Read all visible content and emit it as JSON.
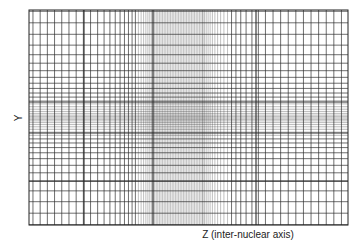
{
  "figure": {
    "x_axis_label": "Z (inter-nuclear axis)",
    "y_axis_label": "Y",
    "line_color": "#2a2a2a",
    "background": "#ffffff"
  }
}
